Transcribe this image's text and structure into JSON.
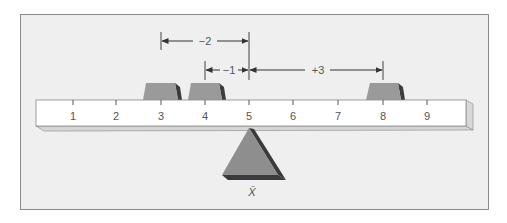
{
  "diagram": {
    "type": "balance-beam",
    "scale": {
      "ticks": [
        "1",
        "2",
        "3",
        "4",
        "5",
        "6",
        "7",
        "8",
        "9"
      ]
    },
    "weights": [
      {
        "position": 3
      },
      {
        "position": 4
      },
      {
        "position": 8
      }
    ],
    "fulcrum": {
      "position": 5,
      "label": "X̄"
    },
    "deviations": [
      {
        "label": "−2",
        "from": 3,
        "to": 5
      },
      {
        "label": "−1",
        "from": 4,
        "to": 5
      },
      {
        "label": "+3",
        "from": 5,
        "to": 8
      }
    ],
    "colors": {
      "background": "#efefef",
      "border": "#8a8a8a",
      "beam_face": "#ffffff",
      "beam_edge": "#d8d8d8",
      "weight": "#9a9a9a",
      "weight_shadow": "#3c3c3c",
      "fulcrum": "#8e8e8e",
      "fulcrum_shadow": "#3a3a3a",
      "text": "#555555"
    }
  }
}
